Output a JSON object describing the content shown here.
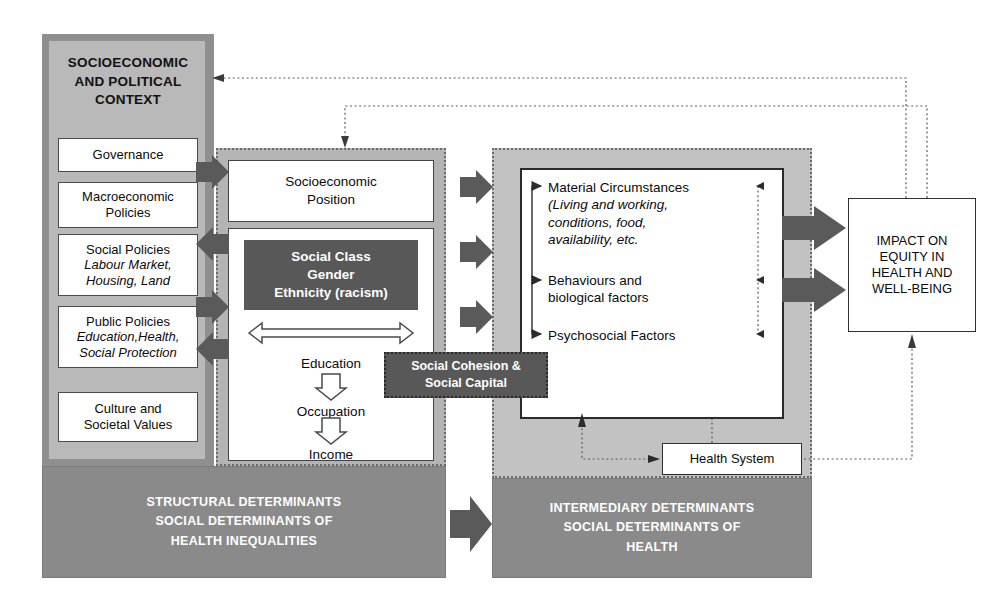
{
  "diagram": {
    "colors": {
      "panel_gray": "#b9b9b9",
      "panel_border": "#8f8f8f",
      "band_gray": "#8a8a8a",
      "dark_box": "#585858",
      "arrow_fill": "#5a5a5a",
      "white": "#ffffff",
      "text": "#0b0b0b"
    }
  },
  "context": {
    "title_line1": "SOCIOECONOMIC",
    "title_line2": "AND POLITICAL",
    "title_line3": "CONTEXT",
    "items": [
      {
        "label": "Governance",
        "sub": ""
      },
      {
        "label": "Macroeconomic",
        "sub": "Policies"
      },
      {
        "label": "Social Policies",
        "sub": "Labour Market,",
        "sub2": "Housing, Land"
      },
      {
        "label": "Public Policies",
        "sub": "Education,Health,",
        "sub2": "Social Protection"
      },
      {
        "label": "Culture and",
        "sub": "Societal Values"
      }
    ]
  },
  "structural": {
    "position_line1": "Socioeconomic",
    "position_line2": "Position",
    "social_class": "Social Class",
    "gender": "Gender",
    "ethnicity": "Ethnicity (racism)",
    "education": "Education",
    "occupation": "Occupation",
    "income": "Income"
  },
  "intermediary": {
    "material_title": "Material Circumstances",
    "material_sub1": "(Living and working,",
    "material_sub2": "conditions, food,",
    "material_sub3": "availability, etc.",
    "behaviours_line1": "Behaviours and",
    "behaviours_line2": "biological factors",
    "psychosocial": "Psychosocial Factors",
    "health_system": "Health System"
  },
  "cohesion": {
    "line1": "Social Cohesion &",
    "line2": "Social Capital"
  },
  "impact": {
    "line1": "IMPACT ON",
    "line2": "EQUITY IN",
    "line3": "HEALTH AND",
    "line4": "WELL-BEING"
  },
  "bands": {
    "structural": {
      "line1": "STRUCTURAL DETERMINANTS",
      "line2": "SOCIAL DETERMINANTS OF",
      "line3": "HEALTH INEQUALITIES"
    },
    "intermediary": {
      "line1": "INTERMEDIARY DETERMINANTS",
      "line2": "SOCIAL DETERMINANTS OF",
      "line3": "HEALTH"
    }
  }
}
